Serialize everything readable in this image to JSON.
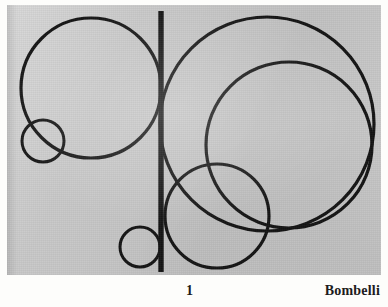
{
  "page": {
    "background_color": "#fdfdfb",
    "plate_background_color": "#c8c8c8",
    "ink_color": "#141414"
  },
  "caption": {
    "plate_number": "1",
    "artist": "Bombelli"
  },
  "artwork": {
    "title": "1",
    "artist": "Bombelli",
    "description": "Abstract geometric composition of seven overlapping circle outlines crossed by a single heavy vertical bar",
    "stroke_color": "#141414",
    "elements": [
      {
        "name": "large-left-circle",
        "shape": "circle",
        "cx": 91,
        "cy": 88,
        "r": 70,
        "stroke_width": 3.2
      },
      {
        "name": "small-left-circle",
        "shape": "circle",
        "cx": 43,
        "cy": 141,
        "r": 21,
        "stroke_width": 3.0
      },
      {
        "name": "outer-right-circle",
        "shape": "circle",
        "cx": 267,
        "cy": 124,
        "r": 107,
        "stroke_width": 3.2
      },
      {
        "name": "inner-right-circle",
        "shape": "circle",
        "cx": 289,
        "cy": 145,
        "r": 83,
        "stroke_width": 3.2
      },
      {
        "name": "bottom-center-circle",
        "shape": "circle",
        "cx": 217,
        "cy": 216,
        "r": 52,
        "stroke_width": 3.2
      },
      {
        "name": "small-bottom-circle",
        "shape": "circle",
        "cx": 140,
        "cy": 247,
        "r": 20,
        "stroke_width": 3.0
      },
      {
        "name": "vertical-bar",
        "shape": "line",
        "x1": 161,
        "y1": 11,
        "x2": 161,
        "y2": 272,
        "stroke_width": 5.4
      }
    ]
  }
}
